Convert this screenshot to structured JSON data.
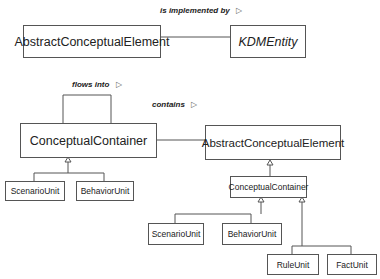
{
  "diagram": {
    "top": {
      "association_label": "is implemented by",
      "source": "AbstractConceptualElement",
      "target": "KDMEntity"
    },
    "left": {
      "self_association_label": "flows into",
      "container": "ConceptualContainer",
      "children": [
        "ScenarioUnit",
        "BehaviorUnit"
      ]
    },
    "right": {
      "association_label": "contains",
      "parent": "AbstractConceptualElement",
      "container": "ConceptualContainer",
      "children": [
        "ScenarioUnit",
        "BehaviorUnit",
        "RuleUnit",
        "FactUnit"
      ]
    },
    "direction_glyph": "▷"
  }
}
